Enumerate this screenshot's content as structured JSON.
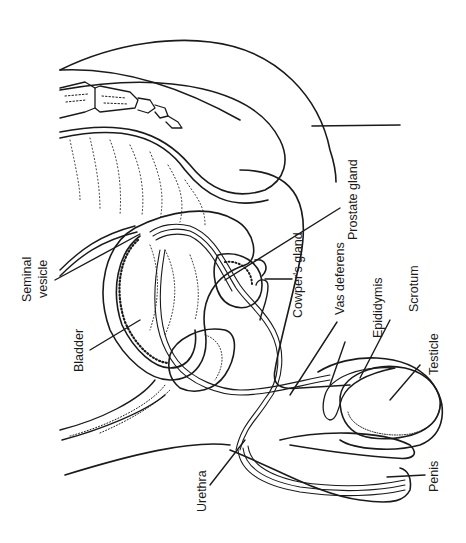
{
  "diagram": {
    "ink_color": "#1a1a1a",
    "background": "#ffffff",
    "labels": {
      "seminal_vesicle_1": "Seminal",
      "seminal_vesicle_2": "vesicle",
      "bladder": "Bladder",
      "cowpers_gland": "Cowper's gland",
      "prostate_gland": "Prostate gland",
      "vas_deferens": "Vas deferens",
      "epididymis": "Epididymis",
      "scrotum": "Scrotum",
      "testicle": "Testicle",
      "urethra": "Urethra",
      "penis": "Penis"
    }
  }
}
